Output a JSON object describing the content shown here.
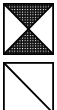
{
  "figure": {
    "background_color": "#ffffff",
    "stroke_color": "#000000",
    "fill_pattern_color": "#111111",
    "pattern_dot_color": "#ffffff",
    "swatch_count": 2
  },
  "swatches": [
    {
      "name": "crossed-square-dotted",
      "label": "X-divided square, dotted fill",
      "shape": "square",
      "border": true,
      "diagonals": "both",
      "filled_triangles": [
        "top",
        "bottom"
      ],
      "empty_triangles": [
        "left",
        "right"
      ],
      "fill_style": "dot-grid",
      "fill_color": "#111111",
      "dot_color": "#ffffff"
    },
    {
      "name": "single-diagonal-square",
      "label": "Square with one diagonal, no fill",
      "shape": "square",
      "border": true,
      "diagonals": "top-left-to-bottom-right",
      "filled_triangles": [],
      "empty_triangles": [
        "upper-right",
        "lower-left"
      ],
      "fill_style": "none",
      "fill_color": "#ffffff",
      "dot_color": "#ffffff"
    }
  ]
}
